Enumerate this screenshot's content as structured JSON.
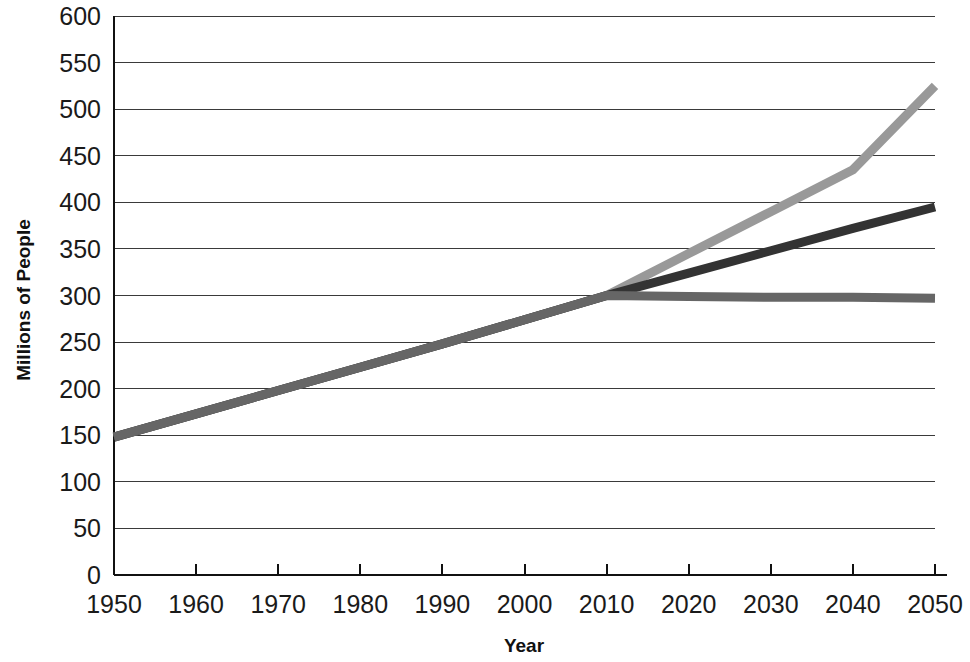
{
  "chart_data": {
    "type": "line",
    "title": "",
    "xlabel": "Year",
    "ylabel": "Millions of People",
    "xlim": [
      1950,
      2050
    ],
    "ylim": [
      0,
      600
    ],
    "grid": true,
    "legend": "none",
    "x": [
      1950,
      1960,
      1970,
      1980,
      1990,
      2000,
      2010,
      2020,
      2030,
      2040,
      2050
    ],
    "xticklabels": [
      "1950",
      "1960",
      "1970",
      "1980",
      "1990",
      "2000",
      "2010",
      "2020",
      "2030",
      "2040",
      "2050"
    ],
    "yticks": [
      0,
      50,
      100,
      150,
      200,
      250,
      300,
      350,
      400,
      450,
      500,
      550,
      600
    ],
    "yticklabels": [
      "0",
      "50",
      "100",
      "150",
      "200",
      "250",
      "300",
      "350",
      "400",
      "450",
      "500",
      "550",
      "600"
    ],
    "series": [
      {
        "name": "high-projection",
        "color": "#999999",
        "width": 9,
        "values": [
          148,
          173,
          198,
          223,
          248,
          274,
          300,
          345,
          390,
          435,
          525
        ]
      },
      {
        "name": "middle-projection",
        "color": "#333333",
        "width": 9,
        "values": [
          148,
          173,
          198,
          223,
          248,
          274,
          300,
          324,
          348,
          372,
          395
        ]
      },
      {
        "name": "low-projection",
        "color": "#666666",
        "width": 9,
        "values": [
          148,
          173,
          198,
          223,
          248,
          274,
          300,
          299,
          298,
          298,
          297
        ]
      }
    ]
  }
}
